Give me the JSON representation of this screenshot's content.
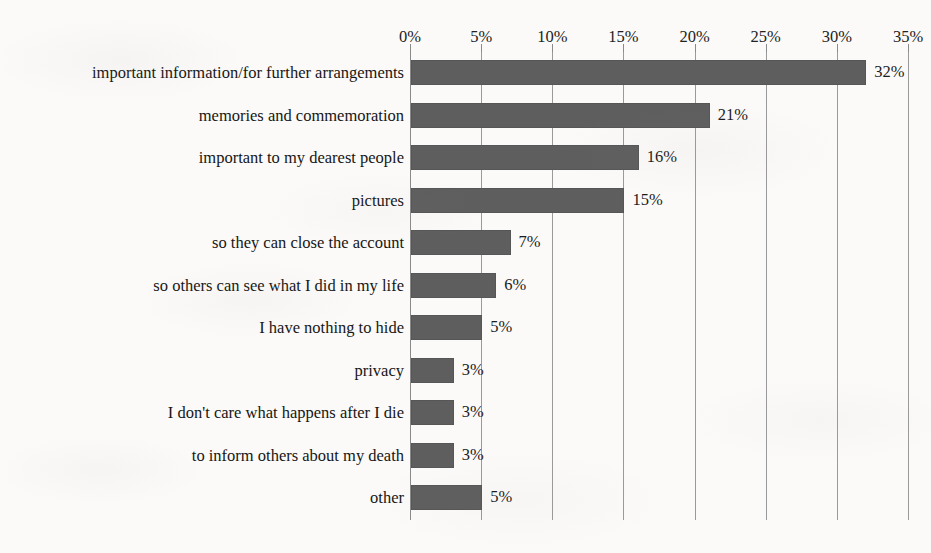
{
  "chart_data": {
    "type": "bar",
    "orientation": "horizontal",
    "title": "",
    "subtitle": "",
    "xlabel": "",
    "ylabel": "",
    "xlim": [
      0,
      35
    ],
    "grid": true,
    "legend": false,
    "x_tick_labels": [
      "0%",
      "5%",
      "10%",
      "15%",
      "20%",
      "25%",
      "30%",
      "35%"
    ],
    "x_tick_values": [
      0,
      5,
      10,
      15,
      20,
      25,
      30,
      35
    ],
    "value_suffix": "%",
    "bar_color": "#5e5e5e",
    "gridline_color": "#9a9a9a",
    "background_color": "#fbfaf8",
    "categories": [
      "important information/for further arrangements",
      "memories and commemoration",
      "important to my dearest people",
      "pictures",
      "so they can close the account",
      "so others can see what I did in my life",
      "I have nothing to hide",
      "privacy",
      "I don't care what happens after I die",
      "to inform others about my death",
      "other"
    ],
    "values": [
      32,
      21,
      16,
      15,
      7,
      6,
      5,
      3,
      3,
      3,
      5
    ],
    "value_labels": [
      "32%",
      "21%",
      "16%",
      "15%",
      "7%",
      "6%",
      "5%",
      "3%",
      "3%",
      "3%",
      "5%"
    ]
  }
}
